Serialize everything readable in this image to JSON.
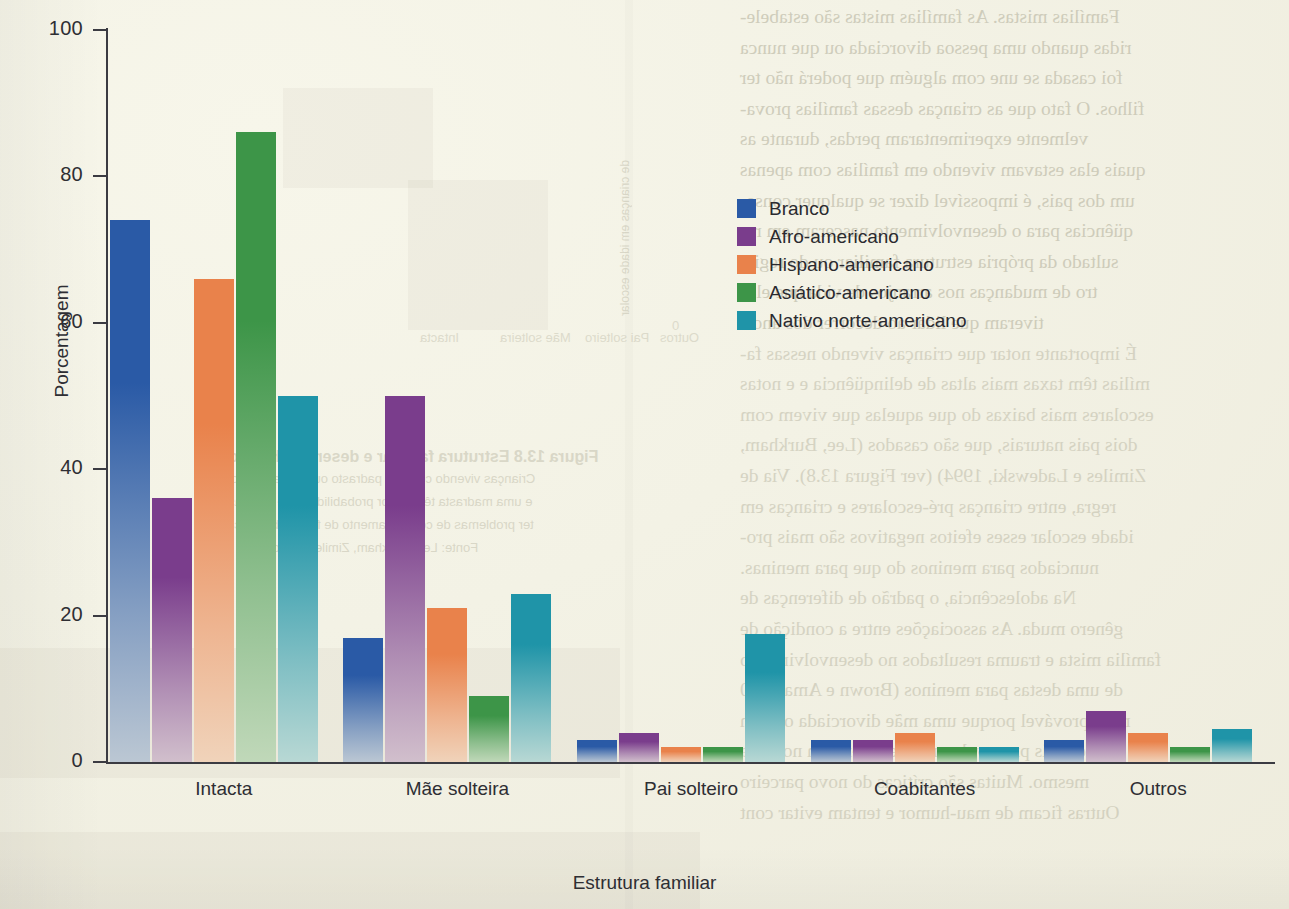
{
  "chart_data": {
    "type": "bar",
    "title": "",
    "xlabel": "Estrutura familiar",
    "ylabel": "Porcentagem",
    "ylim": [
      0,
      100
    ],
    "yticks": [
      "0",
      "20",
      "40",
      "60",
      "80",
      "100"
    ],
    "grid": false,
    "legend_position": "upper-center-right",
    "categories": [
      "Intacta",
      "Mãe solteira",
      "Pai solteiro",
      "Coabitantes",
      "Outros"
    ],
    "series": [
      {
        "name": "Branco",
        "color": "#2a5aa6",
        "values": [
          74,
          17,
          3,
          3,
          3
        ]
      },
      {
        "name": "Afro-americano",
        "color": "#7a3d8c",
        "values": [
          36,
          50,
          4,
          3,
          7
        ]
      },
      {
        "name": "Hispano-americano",
        "color": "#e9824b",
        "values": [
          66,
          21,
          2,
          4,
          4
        ]
      },
      {
        "name": "Asiático-americano",
        "color": "#3d9548",
        "values": [
          86,
          9,
          2,
          2,
          2
        ]
      },
      {
        "name": "Nativo norte-americano",
        "color": "#1f94a8",
        "values": [
          50,
          23,
          17.5,
          2,
          4.5
        ]
      }
    ]
  },
  "bleed_through": {
    "lines": [
      "Famílias mistas.  As famílias mistas são estabele-",
      "ridas quando uma pessoa divorciada ou que nunca",
      "foi casada se une com alguém que poderá não ter",
      "filhos. O fato que as crianças dessas famílias prova-",
      "velmente experimentaram perdas, durante as",
      "quais elas estavam vivendo em famílias com apenas",
      "um dos pais, é impossível dizer se qualquer conse-",
      "qüências para o desenvolvimento nasceram em re-",
      "sultado da própria estrutura familiar ou do regis-",
      "tro de mudanças nos arranjos de vida que elas",
      "tiveram que lidar ao decorrer dos anos.",
      "É importante notar que crianças vivendo nessas fa-",
      "mílias têm taxas mais altas de delinqüência e e notas",
      "escolares mais baixas do que aquelas que vivem com",
      "dois pais naturais, que são casados (Lee, Burkham,",
      "Zimiles e Ladewski, 1994) (ver Figura 13.8). Via de",
      "regra, entre crianças pré-escolares e crianças em",
      "idade escolar esses efeitos negativos são mais pro-",
      "nunciados para meninos do que para meninas.",
      "Na adolescência, o padrão de diferenças de",
      "gênero muda. As associações entre a condição de",
      "família mista e trauma resultados no desenvolvimento",
      "de uma destas para meninos (Brown e Amato, 20",
      "mais provável porque uma mãe divorciada ou nun",
      "junto mais provavelmente, reduzem um novo pa",
      "mesmo. Muitas são críticas do novo parceiro",
      "Outras ficam de mau-humor e tentam evitar cont"
    ],
    "figure_caption_lines": [
      "Figura 13.8   Estrutura familiar e desempenho escolar",
      "Crianças vivendo com um padrasto ou madrasta são mais",
      "e uma madrasta têm maior probabilidade de ter, elas aqui",
      "ter problemas de comportamento de família biológica, tive",
      "Fonte: Lee, Burkham, Zimiles e Ladewski, 1994."
    ],
    "sidebar_vertical": "de crianças em idade escolar",
    "ghost_axis_labels": [
      "Intacta",
      "Mãe solteira",
      "Pai solteiro",
      "Outros"
    ],
    "ghost_ytick": "0"
  }
}
